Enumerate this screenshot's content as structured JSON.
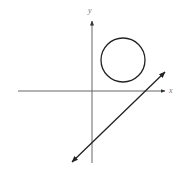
{
  "diagram": {
    "type": "coordinate-plane",
    "axes": {
      "x_label": "x",
      "y_label": "y",
      "origin": [
        92,
        91
      ],
      "x_axis": {
        "from": [
          18,
          91
        ],
        "to": [
          166,
          91
        ]
      },
      "y_axis": {
        "from": [
          92,
          163
        ],
        "to": [
          92,
          20
        ]
      },
      "color": "#555555"
    },
    "circle": {
      "center": [
        123,
        60
      ],
      "radius": 22,
      "quadrant": "I",
      "stroke": "#222222"
    },
    "line": {
      "from": [
        71,
        163
      ],
      "to": [
        166,
        71
      ],
      "arrows": "both",
      "slope_sign": "positive",
      "crosses_x_axis_at": [
        146,
        91
      ],
      "stroke": "#222222"
    }
  }
}
